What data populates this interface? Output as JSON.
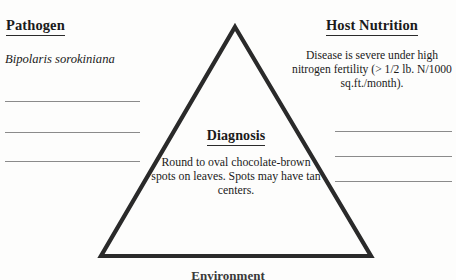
{
  "diagram": {
    "type": "disease-triangle",
    "background_color": "#fdfdfc",
    "line_color": "#2a2a2a",
    "rule_color": "#8b8b8b",
    "triangle": {
      "apex": [
        235,
        27
      ],
      "base_left": [
        101,
        256
      ],
      "base_right": [
        371,
        256
      ],
      "stroke_width": 4
    }
  },
  "left_panel": {
    "heading": "Pathogen",
    "species": "Bipolaris sorokiniana",
    "blank_line_count": 3
  },
  "right_panel": {
    "heading": "Host Nutrition",
    "body": "Disease is severe under high nitrogen fertility (> 1/2 lb. N/1000 sq.ft./month).",
    "blank_line_count": 3
  },
  "center_panel": {
    "heading": "Diagnosis",
    "body": "Round to oval chocolate-brown spots on leaves.  Spots may have tan centers."
  },
  "bottom_caption": {
    "text": "Environment"
  }
}
